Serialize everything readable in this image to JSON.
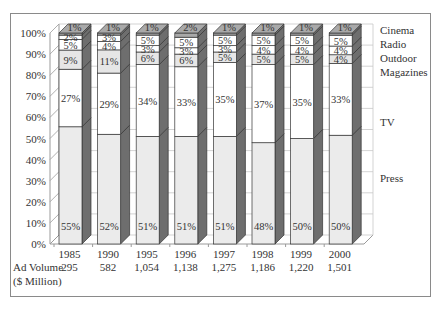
{
  "chart_data": {
    "type": "bar",
    "stacked": true,
    "percent": true,
    "three_d": true,
    "title": "",
    "xlabel": "",
    "ylabel": "",
    "ylim": [
      0,
      100
    ],
    "y_ticks": [
      "0%",
      "10%",
      "20%",
      "30%",
      "40%",
      "50%",
      "60%",
      "70%",
      "80%",
      "90%",
      "100%"
    ],
    "categories": [
      "1985",
      "1990",
      "1995",
      "1996",
      "1997",
      "1998",
      "1999",
      "2000"
    ],
    "series": [
      {
        "name": "Press",
        "values": [
          55,
          52,
          51,
          51,
          51,
          48,
          50,
          50
        ]
      },
      {
        "name": "TV",
        "values": [
          27,
          29,
          34,
          33,
          35,
          37,
          35,
          33
        ]
      },
      {
        "name": "Magazines",
        "values": [
          9,
          11,
          6,
          6,
          5,
          5,
          5,
          4
        ]
      },
      {
        "name": "Outdoor",
        "values": [
          5,
          4,
          3,
          3,
          3,
          4,
          4,
          4
        ]
      },
      {
        "name": "Radio",
        "values": [
          2,
          3,
          5,
          5,
          5,
          5,
          5,
          5
        ]
      },
      {
        "name": "Cinema",
        "values": [
          1,
          1,
          1,
          2,
          1,
          1,
          1,
          1
        ]
      }
    ],
    "legend": [
      "Cinema",
      "Radio",
      "Outdoor",
      "Magazines",
      "TV",
      "Press"
    ],
    "legend_position": "right",
    "grid": true,
    "ad_volume": {
      "label_line1": "Ad Volume",
      "label_line2": "($ Million)",
      "values": [
        "295",
        "582",
        "1,054",
        "1,138",
        "1,275",
        "1,186",
        "1,220",
        "1,501"
      ]
    }
  },
  "colors": {
    "press": "#ebebeb",
    "tv": "#ffffff",
    "magazines": "#e6e6e6",
    "outdoor": "#ffffff",
    "radio": "#ffffff",
    "cinema": "#a9a9a9",
    "side": "#6e6e6e",
    "border": "#8a8a8a",
    "grid": "#9a9a9a"
  }
}
